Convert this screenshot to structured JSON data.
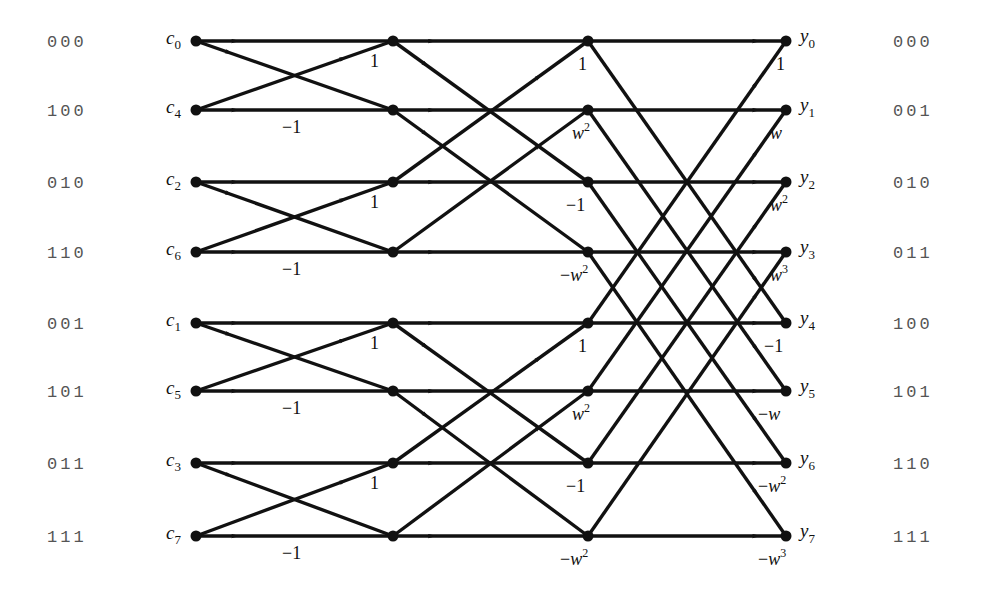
{
  "diagram": {
    "type": "fft-butterfly",
    "arrow_color": "#111111",
    "columns_x": [
      196,
      393,
      588,
      786
    ],
    "rows_y": [
      41,
      110,
      182,
      252,
      323,
      391,
      463,
      536
    ],
    "left_bits": [
      "000",
      "100",
      "010",
      "110",
      "001",
      "101",
      "011",
      "111"
    ],
    "right_bits": [
      "000",
      "001",
      "010",
      "011",
      "100",
      "101",
      "110",
      "111"
    ],
    "inputs": [
      {
        "base": "c",
        "sub": "0"
      },
      {
        "base": "c",
        "sub": "4"
      },
      {
        "base": "c",
        "sub": "2"
      },
      {
        "base": "c",
        "sub": "6"
      },
      {
        "base": "c",
        "sub": "1"
      },
      {
        "base": "c",
        "sub": "5"
      },
      {
        "base": "c",
        "sub": "3"
      },
      {
        "base": "c",
        "sub": "7"
      }
    ],
    "outputs": [
      {
        "base": "y",
        "sub": "0"
      },
      {
        "base": "y",
        "sub": "1"
      },
      {
        "base": "y",
        "sub": "2"
      },
      {
        "base": "y",
        "sub": "3"
      },
      {
        "base": "y",
        "sub": "4"
      },
      {
        "base": "y",
        "sub": "5"
      },
      {
        "base": "y",
        "sub": "6"
      },
      {
        "base": "y",
        "sub": "7"
      }
    ],
    "stage1_weights": [
      {
        "row": 0,
        "text": "1"
      },
      {
        "row": 1,
        "text": "−1"
      },
      {
        "row": 2,
        "text": "1"
      },
      {
        "row": 3,
        "text": "−1"
      },
      {
        "row": 4,
        "text": "1"
      },
      {
        "row": 5,
        "text": "−1"
      },
      {
        "row": 6,
        "text": "1"
      },
      {
        "row": 7,
        "text": "−1"
      }
    ],
    "stage2_weights": [
      {
        "row": 0,
        "pre": "",
        "base": "1",
        "sup": ""
      },
      {
        "row": 1,
        "pre": "",
        "base": "w",
        "sup": "2"
      },
      {
        "row": 2,
        "pre": "−",
        "base": "1",
        "sup": ""
      },
      {
        "row": 3,
        "pre": "−",
        "base": "w",
        "sup": "2"
      },
      {
        "row": 4,
        "pre": "",
        "base": "1",
        "sup": ""
      },
      {
        "row": 5,
        "pre": "",
        "base": "w",
        "sup": "2"
      },
      {
        "row": 6,
        "pre": "−",
        "base": "1",
        "sup": ""
      },
      {
        "row": 7,
        "pre": "−",
        "base": "w",
        "sup": "2"
      }
    ],
    "stage3_weights": [
      {
        "row": 0,
        "pre": "",
        "base": "1",
        "sup": ""
      },
      {
        "row": 1,
        "pre": "",
        "base": "w",
        "sup": ""
      },
      {
        "row": 2,
        "pre": "",
        "base": "w",
        "sup": "2"
      },
      {
        "row": 3,
        "pre": "",
        "base": "w",
        "sup": "3"
      },
      {
        "row": 4,
        "pre": "−",
        "base": "1",
        "sup": ""
      },
      {
        "row": 5,
        "pre": "−",
        "base": "w",
        "sup": ""
      },
      {
        "row": 6,
        "pre": "−",
        "base": "w",
        "sup": "2"
      },
      {
        "row": 7,
        "pre": "−",
        "base": "w",
        "sup": "3"
      }
    ]
  }
}
